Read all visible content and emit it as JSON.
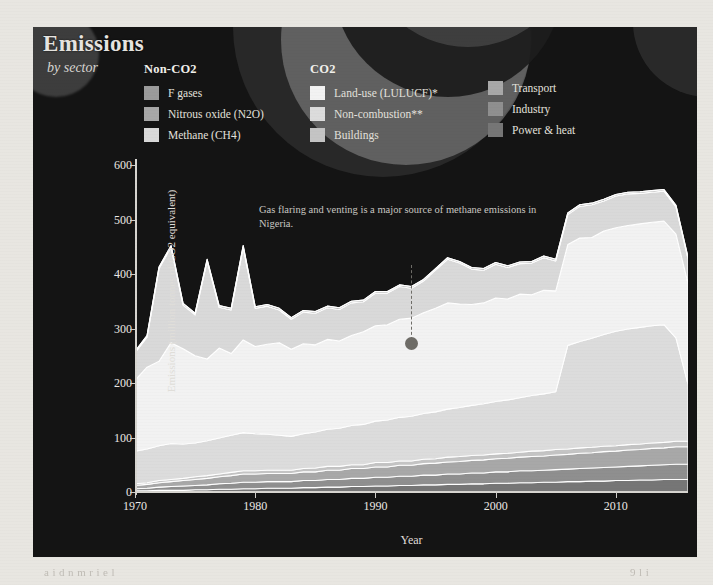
{
  "header": {
    "title": "Emissions",
    "subtitle": "by sector"
  },
  "legend": {
    "groups": [
      {
        "name": "non-co2",
        "heading": "Non-CO2",
        "items": [
          {
            "label": "F gases",
            "color": "#9b9b9b"
          },
          {
            "label": "Nitrous oxide (N2O)",
            "color": "#a7a7a7"
          },
          {
            "label": "Methane (CH4)",
            "color": "#d9d9d9"
          }
        ]
      },
      {
        "name": "co2",
        "heading": "CO2",
        "items": [
          {
            "label": "Land-use (LULUCF)*",
            "color": "#f2f2f2"
          },
          {
            "label": "Non-combustion**",
            "color": "#dcdcdc"
          },
          {
            "label": "Buildings",
            "color": "#c4c4c4"
          }
        ]
      },
      {
        "name": "co2-right",
        "heading": "",
        "items": [
          {
            "label": "Transport",
            "color": "#a8a8a8"
          },
          {
            "label": "Industry",
            "color": "#8f8f8f"
          },
          {
            "label": "Power & heat",
            "color": "#767676"
          }
        ]
      }
    ]
  },
  "annotation": {
    "text": "Gas flaring and venting is a major source of methane emissions in Nigeria."
  },
  "chart_data": {
    "type": "area",
    "title": "Emissions by sector",
    "xlabel": "Year",
    "ylabel": "Emissions (million tonnes of CO2 equivalent)",
    "xlim": [
      1970,
      2016
    ],
    "ylim": [
      0,
      600
    ],
    "yticks": [
      0,
      100,
      200,
      300,
      400,
      500,
      600
    ],
    "xticks": [
      1970,
      1980,
      1990,
      2000,
      2010
    ],
    "grid": false,
    "legend_position": "top",
    "stacked": true,
    "x": [
      1970,
      1971,
      1972,
      1973,
      1974,
      1975,
      1976,
      1977,
      1978,
      1979,
      1980,
      1981,
      1982,
      1983,
      1984,
      1985,
      1986,
      1987,
      1988,
      1989,
      1990,
      1991,
      1992,
      1993,
      1994,
      1995,
      1996,
      1997,
      1998,
      1999,
      2000,
      2001,
      2002,
      2003,
      2004,
      2005,
      2006,
      2007,
      2008,
      2009,
      2010,
      2011,
      2012,
      2013,
      2014,
      2015,
      2016
    ],
    "series": [
      {
        "name": "Power & heat",
        "color": "#767676",
        "values": [
          2,
          2,
          3,
          3,
          3,
          4,
          4,
          5,
          5,
          6,
          6,
          7,
          7,
          7,
          8,
          8,
          9,
          9,
          10,
          10,
          11,
          11,
          12,
          12,
          13,
          13,
          14,
          14,
          15,
          15,
          16,
          16,
          17,
          17,
          18,
          18,
          19,
          19,
          20,
          20,
          21,
          21,
          22,
          22,
          23,
          23,
          23
        ]
      },
      {
        "name": "Industry",
        "color": "#8f8f8f",
        "values": [
          4,
          5,
          6,
          7,
          8,
          8,
          9,
          10,
          11,
          12,
          12,
          12,
          12,
          12,
          13,
          13,
          14,
          14,
          15,
          15,
          16,
          16,
          17,
          17,
          18,
          18,
          19,
          19,
          20,
          20,
          21,
          21,
          22,
          22,
          22,
          23,
          23,
          24,
          24,
          25,
          25,
          26,
          26,
          27,
          27,
          28,
          28
        ]
      },
      {
        "name": "Transport",
        "color": "#a8a8a8",
        "values": [
          6,
          7,
          8,
          9,
          10,
          11,
          12,
          13,
          14,
          15,
          15,
          15,
          15,
          15,
          16,
          16,
          17,
          17,
          18,
          18,
          19,
          19,
          20,
          20,
          21,
          22,
          22,
          23,
          23,
          24,
          24,
          25,
          25,
          26,
          26,
          27,
          27,
          28,
          28,
          29,
          29,
          30,
          30,
          31,
          31,
          32,
          32
        ]
      },
      {
        "name": "Buildings",
        "color": "#c4c4c4",
        "values": [
          3,
          3,
          4,
          4,
          4,
          5,
          5,
          5,
          6,
          6,
          6,
          6,
          6,
          6,
          6,
          7,
          7,
          7,
          7,
          7,
          8,
          8,
          8,
          8,
          8,
          8,
          9,
          9,
          9,
          9,
          9,
          9,
          9,
          10,
          10,
          10,
          10,
          10,
          10,
          10,
          10,
          10,
          10,
          10,
          10,
          10,
          10
        ]
      },
      {
        "name": "Non-combustion**",
        "color": "#dcdcdc",
        "values": [
          60,
          62,
          64,
          66,
          63,
          62,
          64,
          66,
          68,
          70,
          68,
          66,
          64,
          62,
          64,
          66,
          68,
          70,
          72,
          74,
          76,
          78,
          80,
          82,
          84,
          86,
          88,
          90,
          92,
          94,
          96,
          98,
          100,
          102,
          104,
          106,
          190,
          195,
          200,
          205,
          210,
          212,
          214,
          215,
          216,
          190,
          105
        ]
      },
      {
        "name": "Land-use (LULUCF)*",
        "color": "#f2f2f2",
        "values": [
          130,
          150,
          155,
          185,
          175,
          160,
          150,
          165,
          150,
          170,
          160,
          165,
          170,
          160,
          165,
          160,
          165,
          160,
          165,
          170,
          175,
          175,
          180,
          180,
          185,
          190,
          195,
          190,
          185,
          185,
          190,
          185,
          190,
          185,
          190,
          185,
          185,
          190,
          185,
          190,
          190,
          190,
          190,
          190,
          190,
          190,
          185
        ]
      },
      {
        "name": "Methane (CH4)",
        "color": "#d9d9d9",
        "values": [
          50,
          55,
          170,
          175,
          80,
          75,
          180,
          75,
          80,
          170,
          70,
          70,
          60,
          55,
          58,
          58,
          58,
          58,
          60,
          55,
          60,
          58,
          60,
          55,
          58,
          70,
          80,
          75,
          65,
          60,
          62,
          58,
          56,
          58,
          60,
          55,
          55,
          58,
          60,
          55,
          58,
          58,
          56,
          55,
          55,
          50,
          45
        ]
      },
      {
        "name": "Nitrous oxide (N2O)",
        "color": "#a7a7a7",
        "values": [
          3,
          3,
          3,
          3,
          3,
          3,
          3,
          3,
          3,
          3,
          3,
          3,
          3,
          3,
          3,
          3,
          3,
          3,
          3,
          3,
          3,
          3,
          3,
          3,
          3,
          3,
          3,
          3,
          3,
          3,
          3,
          3,
          3,
          3,
          3,
          3,
          3,
          3,
          3,
          3,
          3,
          3,
          3,
          3,
          3,
          3,
          3
        ]
      },
      {
        "name": "F gases",
        "color": "#9b9b9b",
        "values": [
          0,
          0,
          0,
          0,
          0,
          0,
          0,
          0,
          0,
          0,
          0,
          0,
          0,
          0,
          0,
          0,
          0,
          0,
          0,
          0,
          0,
          0,
          0,
          0,
          0,
          0,
          0,
          0,
          0,
          0,
          0,
          0,
          0,
          0,
          0,
          0,
          0,
          0,
          0,
          0,
          0,
          0,
          0,
          0,
          0,
          0,
          0
        ]
      }
    ]
  },
  "ghost": {
    "bottom_left": "a i d  n  m  r  i  e  l",
    "bottom_right": "9  l  i"
  }
}
